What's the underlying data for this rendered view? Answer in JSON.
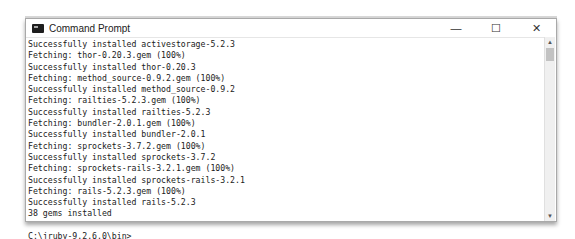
{
  "window": {
    "title": "Command Prompt",
    "controls": {
      "minimize": "—",
      "maximize": "☐",
      "close": "✕"
    }
  },
  "console": {
    "lines": [
      "Successfully installed activestorage-5.2.3",
      "Fetching: thor-0.20.3.gem (100%)",
      "Successfully installed thor-0.20.3",
      "Fetching: method_source-0.9.2.gem (100%)",
      "Successfully installed method_source-0.9.2",
      "Fetching: railties-5.2.3.gem (100%)",
      "Successfully installed railties-5.2.3",
      "Fetching: bundler-2.0.1.gem (100%)",
      "Successfully installed bundler-2.0.1",
      "Fetching: sprockets-3.7.2.gem (100%)",
      "Successfully installed sprockets-3.7.2",
      "Fetching: sprockets-rails-3.2.1.gem (100%)",
      "Successfully installed sprockets-rails-3.2.1",
      "Fetching: rails-5.2.3.gem (100%)",
      "Successfully installed rails-5.2.3",
      "38 gems installed",
      "",
      "C:\\jruby-9.2.6.0\\bin>"
    ]
  },
  "scrollbar": {
    "up": "▲",
    "down": "▼"
  }
}
